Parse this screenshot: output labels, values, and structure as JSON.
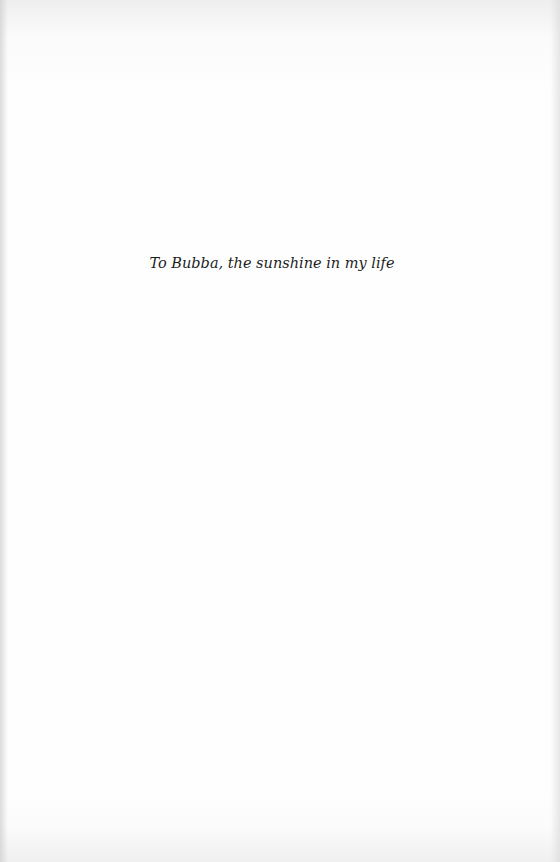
{
  "page": {
    "background": "#fefefe",
    "text_color": "#1e1e1e"
  },
  "dedication": {
    "text": "To Bubba, the sunshine in my life"
  }
}
